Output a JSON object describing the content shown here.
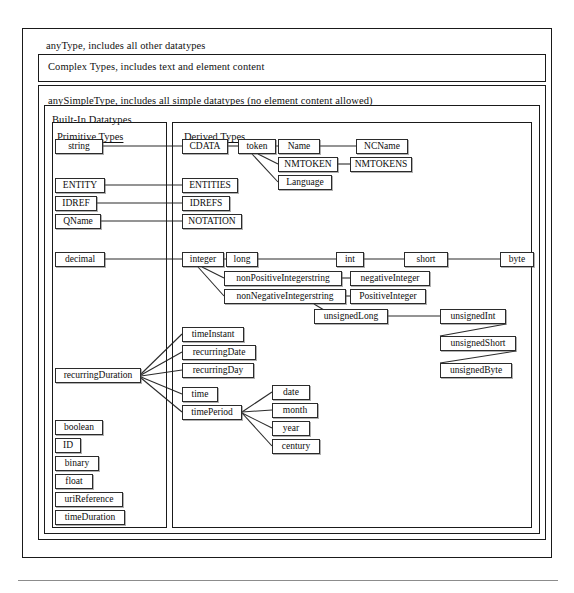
{
  "diagram": {
    "containers": [
      {
        "name": "anytype-frame",
        "label": "anyType, includes all other datatypes",
        "x": 22,
        "y": 28,
        "w": 528,
        "h": 528,
        "lx": 46,
        "ly": 40
      },
      {
        "name": "complextypes-frame",
        "label": "Complex Types, includes text and element content",
        "x": 38,
        "y": 54,
        "w": 506,
        "h": 26,
        "lx": 48,
        "ly": 61
      },
      {
        "name": "anysimpletype-frame",
        "label": "anySimpleType, includes all simple datatypes (no element content allowed)",
        "x": 38,
        "y": 85,
        "w": 506,
        "h": 453,
        "lx": 48,
        "ly": 95
      },
      {
        "name": "builtin-frame",
        "label": "Built-In Datatypes",
        "x": 44,
        "y": 105,
        "w": 494,
        "h": 427,
        "lx": 52,
        "ly": 114
      }
    ],
    "panels": [
      {
        "name": "primitive-types-panel",
        "title": "Primitive Types",
        "x": 52,
        "y": 122,
        "w": 113,
        "h": 404,
        "tx": 57,
        "ty": 131
      },
      {
        "name": "derived-types-panel",
        "title": "Derived Types",
        "x": 172,
        "y": 122,
        "w": 358,
        "h": 404,
        "tx": 184,
        "ty": 131
      }
    ],
    "nodes": [
      {
        "name": "node-string",
        "label": "string",
        "x": 55,
        "y": 139,
        "w": 48,
        "h": 15
      },
      {
        "name": "node-entity",
        "label": "ENTITY",
        "x": 55,
        "y": 178,
        "w": 50,
        "h": 15
      },
      {
        "name": "node-idref",
        "label": "IDREF",
        "x": 55,
        "y": 196,
        "w": 42,
        "h": 15
      },
      {
        "name": "node-qname",
        "label": "QName",
        "x": 55,
        "y": 214,
        "w": 46,
        "h": 15
      },
      {
        "name": "node-decimal",
        "label": "decimal",
        "x": 55,
        "y": 252,
        "w": 50,
        "h": 15
      },
      {
        "name": "node-recurringduration",
        "label": "recurringDuration",
        "x": 55,
        "y": 368,
        "w": 86,
        "h": 15
      },
      {
        "name": "node-boolean",
        "label": "boolean",
        "x": 55,
        "y": 420,
        "w": 48,
        "h": 15
      },
      {
        "name": "node-id",
        "label": "ID",
        "x": 55,
        "y": 438,
        "w": 26,
        "h": 15
      },
      {
        "name": "node-binary",
        "label": "binary",
        "x": 55,
        "y": 456,
        "w": 44,
        "h": 15
      },
      {
        "name": "node-float",
        "label": "float",
        "x": 55,
        "y": 474,
        "w": 38,
        "h": 15
      },
      {
        "name": "node-urireference",
        "label": "uriReference",
        "x": 55,
        "y": 492,
        "w": 68,
        "h": 15
      },
      {
        "name": "node-timeduration",
        "label": "timeDuration",
        "x": 55,
        "y": 510,
        "w": 70,
        "h": 15
      },
      {
        "name": "node-cdata",
        "label": "CDATA",
        "x": 182,
        "y": 139,
        "w": 46,
        "h": 15
      },
      {
        "name": "node-token",
        "label": "token",
        "x": 238,
        "y": 139,
        "w": 38,
        "h": 15
      },
      {
        "name": "node-name",
        "label": "Name",
        "x": 278,
        "y": 139,
        "w": 42,
        "h": 15
      },
      {
        "name": "node-ncname",
        "label": "NCName",
        "x": 356,
        "y": 139,
        "w": 52,
        "h": 15
      },
      {
        "name": "node-nmtoken",
        "label": "NMTOKEN",
        "x": 278,
        "y": 157,
        "w": 60,
        "h": 15
      },
      {
        "name": "node-nmtokens",
        "label": "NMTOKENS",
        "x": 350,
        "y": 157,
        "w": 62,
        "h": 15
      },
      {
        "name": "node-language",
        "label": "Language",
        "x": 278,
        "y": 175,
        "w": 54,
        "h": 15
      },
      {
        "name": "node-entities",
        "label": "ENTITIES",
        "x": 182,
        "y": 178,
        "w": 56,
        "h": 15
      },
      {
        "name": "node-idrefs",
        "label": "IDREFS",
        "x": 182,
        "y": 196,
        "w": 48,
        "h": 15
      },
      {
        "name": "node-notation",
        "label": "NOTATION",
        "x": 182,
        "y": 214,
        "w": 60,
        "h": 15
      },
      {
        "name": "node-integer",
        "label": "integer",
        "x": 182,
        "y": 252,
        "w": 42,
        "h": 15
      },
      {
        "name": "node-long",
        "label": "long",
        "x": 226,
        "y": 252,
        "w": 32,
        "h": 15
      },
      {
        "name": "node-int",
        "label": "int",
        "x": 336,
        "y": 252,
        "w": 28,
        "h": 15
      },
      {
        "name": "node-short",
        "label": "short",
        "x": 404,
        "y": 252,
        "w": 44,
        "h": 15
      },
      {
        "name": "node-byte",
        "label": "byte",
        "x": 500,
        "y": 252,
        "w": 34,
        "h": 15
      },
      {
        "name": "node-nonpositiveintegerstring",
        "label": "nonPositiveIntegerstring",
        "x": 224,
        "y": 271,
        "w": 118,
        "h": 15
      },
      {
        "name": "node-negativeinteger",
        "label": "negativeInteger",
        "x": 350,
        "y": 271,
        "w": 80,
        "h": 15
      },
      {
        "name": "node-nonnegativeintegerstring",
        "label": "nonNegativeIntegerstring",
        "x": 224,
        "y": 289,
        "w": 122,
        "h": 15
      },
      {
        "name": "node-positiveinteger",
        "label": "PositiveInteger",
        "x": 350,
        "y": 289,
        "w": 76,
        "h": 15
      },
      {
        "name": "node-unsignedlong",
        "label": "unsignedLong",
        "x": 314,
        "y": 309,
        "w": 74,
        "h": 15
      },
      {
        "name": "node-unsignedint",
        "label": "unsignedInt",
        "x": 440,
        "y": 309,
        "w": 66,
        "h": 15
      },
      {
        "name": "node-unsignedshort",
        "label": "unsignedShort",
        "x": 440,
        "y": 336,
        "w": 76,
        "h": 15
      },
      {
        "name": "node-unsignedbyte",
        "label": "unsignedByte",
        "x": 440,
        "y": 363,
        "w": 72,
        "h": 15
      },
      {
        "name": "node-timeinstant",
        "label": "timeInstant",
        "x": 182,
        "y": 327,
        "w": 62,
        "h": 15
      },
      {
        "name": "node-recurringdate",
        "label": "recurringDate",
        "x": 182,
        "y": 345,
        "w": 74,
        "h": 15
      },
      {
        "name": "node-recurringday",
        "label": "recurringDay",
        "x": 182,
        "y": 363,
        "w": 72,
        "h": 15
      },
      {
        "name": "node-time",
        "label": "time",
        "x": 182,
        "y": 387,
        "w": 36,
        "h": 15
      },
      {
        "name": "node-timeperiod",
        "label": "timePeriod",
        "x": 182,
        "y": 405,
        "w": 60,
        "h": 15
      },
      {
        "name": "node-date",
        "label": "date",
        "x": 272,
        "y": 385,
        "w": 38,
        "h": 15
      },
      {
        "name": "node-month",
        "label": "month",
        "x": 272,
        "y": 403,
        "w": 46,
        "h": 15
      },
      {
        "name": "node-year",
        "label": "year",
        "x": 272,
        "y": 421,
        "w": 38,
        "h": 15
      },
      {
        "name": "node-century",
        "label": "century",
        "x": 272,
        "y": 439,
        "w": 48,
        "h": 15
      }
    ],
    "links": [
      {
        "name": "link-string-cdata",
        "x1": 103,
        "y1": 146,
        "x2": 182,
        "y2": 146
      },
      {
        "name": "link-cdata-token",
        "x1": 228,
        "y1": 146,
        "x2": 238,
        "y2": 146
      },
      {
        "name": "link-token-name",
        "x1": 276,
        "y1": 146,
        "x2": 278,
        "y2": 146
      },
      {
        "name": "link-name-ncname",
        "x1": 320,
        "y1": 146,
        "x2": 356,
        "y2": 146
      },
      {
        "name": "link-token-nmtoken",
        "x1": 258,
        "y1": 154,
        "x2": 278,
        "y2": 164
      },
      {
        "name": "link-nmtoken-nmtokens",
        "x1": 338,
        "y1": 164,
        "x2": 350,
        "y2": 164
      },
      {
        "name": "link-token-language",
        "x1": 252,
        "y1": 154,
        "x2": 278,
        "y2": 182
      },
      {
        "name": "link-entity-entities",
        "x1": 105,
        "y1": 185,
        "x2": 182,
        "y2": 185
      },
      {
        "name": "link-idref-idrefs",
        "x1": 97,
        "y1": 203,
        "x2": 182,
        "y2": 203
      },
      {
        "name": "link-qname-notation",
        "x1": 101,
        "y1": 221,
        "x2": 182,
        "y2": 221
      },
      {
        "name": "link-decimal-integer",
        "x1": 105,
        "y1": 259,
        "x2": 182,
        "y2": 259
      },
      {
        "name": "link-integer-long",
        "x1": 224,
        "y1": 259,
        "x2": 226,
        "y2": 259
      },
      {
        "name": "link-long-int",
        "x1": 258,
        "y1": 259,
        "x2": 336,
        "y2": 259
      },
      {
        "name": "link-int-short",
        "x1": 364,
        "y1": 259,
        "x2": 404,
        "y2": 259
      },
      {
        "name": "link-short-byte",
        "x1": 448,
        "y1": 259,
        "x2": 500,
        "y2": 259
      },
      {
        "name": "link-integer-nonpositive",
        "x1": 202,
        "y1": 267,
        "x2": 224,
        "y2": 278
      },
      {
        "name": "link-nonpositive-negative",
        "x1": 342,
        "y1": 278,
        "x2": 350,
        "y2": 278
      },
      {
        "name": "link-integer-nonnegative",
        "x1": 198,
        "y1": 267,
        "x2": 224,
        "y2": 296
      },
      {
        "name": "link-nonnegative-positive",
        "x1": 346,
        "y1": 296,
        "x2": 350,
        "y2": 296
      },
      {
        "name": "link-nonnegative-unsignedlong",
        "x1": 314,
        "y1": 304,
        "x2": 334,
        "y2": 316
      },
      {
        "name": "link-unsignedlong-unsignedint",
        "x1": 388,
        "y1": 316,
        "x2": 440,
        "y2": 316
      },
      {
        "name": "link-unsignedint-unsignedshort",
        "x1": 506,
        "y1": 324,
        "x2": 440,
        "y2": 336
      },
      {
        "name": "link-unsignedshort-unsignedbyte",
        "x1": 516,
        "y1": 351,
        "x2": 440,
        "y2": 363
      },
      {
        "name": "link-recurringduration-timeinstant",
        "x1": 141,
        "y1": 374,
        "x2": 182,
        "y2": 334
      },
      {
        "name": "link-recurringduration-recurringdate",
        "x1": 141,
        "y1": 375,
        "x2": 182,
        "y2": 352
      },
      {
        "name": "link-recurringduration-recurringday",
        "x1": 141,
        "y1": 376,
        "x2": 182,
        "y2": 370
      },
      {
        "name": "link-recurringduration-time",
        "x1": 141,
        "y1": 377,
        "x2": 182,
        "y2": 394
      },
      {
        "name": "link-recurringduration-timeperiod",
        "x1": 141,
        "y1": 378,
        "x2": 182,
        "y2": 412
      },
      {
        "name": "link-timeperiod-date",
        "x1": 242,
        "y1": 412,
        "x2": 272,
        "y2": 392
      },
      {
        "name": "link-timeperiod-month",
        "x1": 242,
        "y1": 412,
        "x2": 272,
        "y2": 410
      },
      {
        "name": "link-timeperiod-year",
        "x1": 242,
        "y1": 413,
        "x2": 272,
        "y2": 428
      },
      {
        "name": "link-timeperiod-century",
        "x1": 242,
        "y1": 413,
        "x2": 272,
        "y2": 446
      }
    ],
    "footer_rule": {
      "name": "footer-rule",
      "x": 18,
      "y": 580,
      "w": 540
    }
  }
}
